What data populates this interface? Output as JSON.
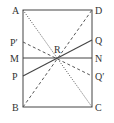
{
  "diagram": {
    "title": "",
    "points": {
      "A": {
        "label": "A",
        "x": 23,
        "y": 10
      },
      "D": {
        "label": "D",
        "x": 92,
        "y": 10
      },
      "B": {
        "label": "B",
        "x": 23,
        "y": 107
      },
      "C": {
        "label": "C",
        "x": 92,
        "y": 107
      },
      "P_prime": {
        "label": "P′",
        "x": 23,
        "y": 42
      },
      "M": {
        "label": "M",
        "x": 23,
        "y": 58
      },
      "P": {
        "label": "P",
        "x": 23,
        "y": 76
      },
      "Q": {
        "label": "Q",
        "x": 92,
        "y": 40
      },
      "N": {
        "label": "N",
        "x": 92,
        "y": 58
      },
      "Q_prime": {
        "label": "Q′",
        "x": 92,
        "y": 76
      },
      "R": {
        "label": "R",
        "x": 58,
        "y": 58
      }
    },
    "segments": [
      {
        "from": "A",
        "to": "D",
        "style": "solid"
      },
      {
        "from": "D",
        "to": "C",
        "style": "solid"
      },
      {
        "from": "C",
        "to": "B",
        "style": "solid"
      },
      {
        "from": "B",
        "to": "A",
        "style": "solid"
      },
      {
        "from": "M",
        "to": "N",
        "style": "solid"
      },
      {
        "from": "P",
        "to": "Q",
        "style": "solid"
      },
      {
        "from": "A",
        "to": "C",
        "style": "dotted"
      },
      {
        "from": "B",
        "to": "D",
        "style": "dashed"
      },
      {
        "from": "P_prime",
        "to": "Q_prime",
        "style": "dashed"
      }
    ],
    "colors": {
      "line": "#444444",
      "label": "#333333"
    }
  }
}
